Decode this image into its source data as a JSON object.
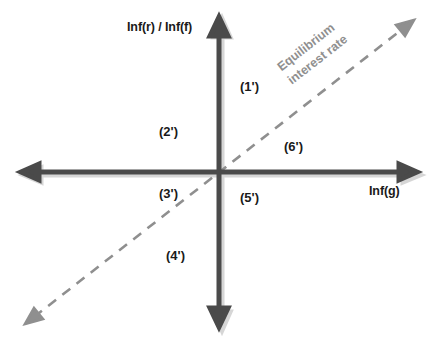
{
  "figure": {
    "type": "cartesian-quadrant-diagram",
    "width": 438,
    "height": 344,
    "background_color": "#ffffff"
  },
  "axes": {
    "color": "#4a4a4a",
    "shadow_color": "#c9c9c9",
    "vertical": {
      "label": "Inf(r) / Inf(f)",
      "x": 219,
      "y_top": 18,
      "y_bottom": 325,
      "arrow_top": true,
      "arrow_bottom": true
    },
    "horizontal": {
      "label": "Inf(g)",
      "y": 172,
      "x_left": 22,
      "x_right": 415,
      "arrow_left": true,
      "arrow_right": true
    },
    "origin": {
      "x": 219,
      "y": 172
    }
  },
  "equilibrium_line": {
    "label_line1": "Equilibrium",
    "label_line2": "interest rate",
    "color": "#8f8f8f",
    "style": "dashed",
    "from": {
      "x": 28,
      "y": 322
    },
    "to": {
      "x": 412,
      "y": 22
    },
    "arrow_start": true,
    "arrow_end": true,
    "rotation_deg": -38
  },
  "quadrant_labels": [
    {
      "text": "(1')",
      "x": 240,
      "y": 79
    },
    {
      "text": "(2')",
      "x": 159,
      "y": 124
    },
    {
      "text": "(3')",
      "x": 159,
      "y": 186
    },
    {
      "text": "(4')",
      "x": 166,
      "y": 248
    },
    {
      "text": "(5')",
      "x": 240,
      "y": 190
    },
    {
      "text": "(6')",
      "x": 284,
      "y": 139
    }
  ]
}
